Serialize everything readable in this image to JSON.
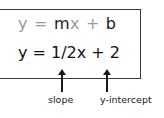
{
  "general_form": {
    "y": "y",
    "equals": "=",
    "m": "m",
    "x": "x",
    "plus": "+",
    "b": "b"
  },
  "specific_form": {
    "text": "y = 1/2x + 2"
  },
  "annotations": {
    "slope_label": "slope",
    "intercept_label": "y-intercept"
  },
  "colors": {
    "muted": "#9a9a9a",
    "emphasis": "#1a1a1a",
    "border": "#3a3a3a"
  }
}
